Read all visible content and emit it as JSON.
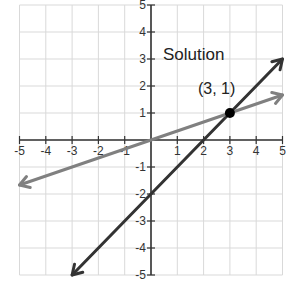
{
  "chart_data": {
    "type": "line",
    "title": "",
    "xlabel": "",
    "ylabel": "",
    "xlim": [
      -5,
      5
    ],
    "ylim": [
      -5,
      5
    ],
    "grid": true,
    "x_ticks": [
      -5,
      -4,
      -3,
      -2,
      -1,
      1,
      2,
      3,
      4,
      5
    ],
    "y_ticks": [
      -5,
      -4,
      -3,
      -2,
      -1,
      1,
      2,
      3,
      4,
      5
    ],
    "series": [
      {
        "name": "y = x - 2",
        "color": "#333333",
        "points": [
          [
            -3,
            -5
          ],
          [
            5,
            3
          ]
        ],
        "arrows": "both"
      },
      {
        "name": "y = x/3",
        "color": "#808080",
        "points": [
          [
            -5,
            -1.667
          ],
          [
            5,
            1.667
          ]
        ],
        "arrows": "both"
      }
    ],
    "annotations": [
      {
        "text": "Solution",
        "x": 0.6,
        "y": 3.2
      },
      {
        "text": "(3, 1)",
        "x": 1.8,
        "y": 1.75
      },
      {
        "type": "point",
        "x": 3,
        "y": 1,
        "color": "#000000"
      }
    ]
  },
  "labels": {
    "solution": "Solution",
    "point": "(3, 1)"
  }
}
